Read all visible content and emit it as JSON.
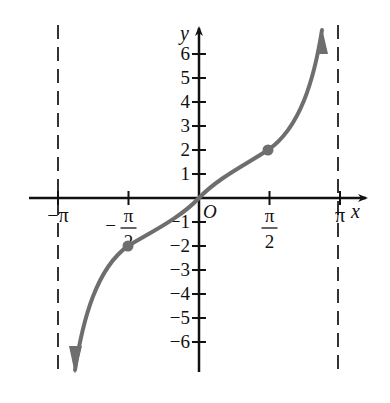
{
  "chart_data": {
    "type": "line",
    "title": "",
    "xlabel": "x",
    "ylabel": "y",
    "origin_label": "O",
    "function": "y = 2 tan(x/2)",
    "x_ticks": [
      {
        "value": -3.1416,
        "label": "−π"
      },
      {
        "value": -1.5708,
        "label_num": "π",
        "label_den": "2",
        "sign": "−"
      },
      {
        "value": 1.5708,
        "label_num": "π",
        "label_den": "2",
        "sign": ""
      },
      {
        "value": 3.1416,
        "label": "π"
      }
    ],
    "y_ticks": [
      {
        "value": 6,
        "label": "6"
      },
      {
        "value": 5,
        "label": "5"
      },
      {
        "value": 4,
        "label": "4"
      },
      {
        "value": 3,
        "label": "3"
      },
      {
        "value": 2,
        "label": "2"
      },
      {
        "value": 1,
        "label": "1"
      },
      {
        "value": -1,
        "label": "−1"
      },
      {
        "value": -2,
        "label": "−2"
      },
      {
        "value": -3,
        "label": "−3"
      },
      {
        "value": -4,
        "label": "−4"
      },
      {
        "value": -5,
        "label": "−5"
      },
      {
        "value": -6,
        "label": "−6"
      }
    ],
    "asymptotes": [
      -3.1416,
      3.1416
    ],
    "marked_points": [
      {
        "x": -1.5708,
        "y": -2
      },
      {
        "x": 1.5708,
        "y": 2
      }
    ],
    "series": [
      {
        "name": "curve",
        "x": [
          -2.75,
          -2.5,
          -2.2,
          -1.9,
          -1.5708,
          -1.2,
          -0.8,
          -0.4,
          0,
          0.4,
          0.8,
          1.2,
          1.5708,
          1.9,
          2.2,
          2.5,
          2.75
        ],
        "y": [
          -6.8,
          -5.4,
          -4.1,
          -2.8,
          -2.0,
          -1.4,
          -0.85,
          -0.4,
          0,
          0.4,
          0.85,
          1.4,
          2.0,
          2.8,
          4.1,
          5.4,
          6.8
        ]
      }
    ],
    "xlim": [
      -3.6,
      3.9
    ],
    "ylim": [
      -7.2,
      7.1
    ],
    "grid": false,
    "legend": "none",
    "colors": {
      "axis": "#111111",
      "curve": "#6e6e6e",
      "asymptote": "#333333",
      "point": "#6e6e6e"
    }
  }
}
